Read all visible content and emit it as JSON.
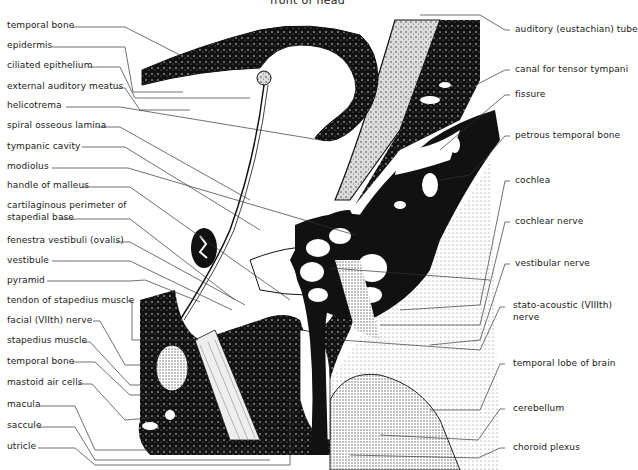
{
  "title": "front of head",
  "left_labels": [
    {
      "text": "temporal bone",
      "y": 20
    },
    {
      "text": "epidermis",
      "y": 40
    },
    {
      "text": "ciliated epithelium",
      "y": 60
    },
    {
      "text": "external auditory meatus",
      "y": 81
    },
    {
      "text": "helicotrema",
      "y": 100
    },
    {
      "text": "spiral osseous lamina",
      "y": 120
    },
    {
      "text": "tympanic cavity",
      "y": 141
    },
    {
      "text": "modiolus",
      "y": 161
    },
    {
      "text": "handle of malleus",
      "y": 180
    },
    {
      "text": "cartilaginous perimeter of",
      "y": 200
    },
    {
      "text": "stapedial base",
      "y": 212
    },
    {
      "text": "fenestra vestibuli (ovalis)",
      "y": 235
    },
    {
      "text": "vestibule",
      "y": 255
    },
    {
      "text": "pyramid",
      "y": 275
    },
    {
      "text": "tendon of stapedius muscle",
      "y": 295
    },
    {
      "text": "facial (VIIth) nerve",
      "y": 315
    },
    {
      "text": "stapedius muscle",
      "y": 335
    },
    {
      "text": "temporal bone",
      "y": 356
    },
    {
      "text": "mastoid air cells",
      "y": 377
    },
    {
      "text": "macula",
      "y": 399
    },
    {
      "text": "saccule",
      "y": 420
    },
    {
      "text": "utricle",
      "y": 441
    }
  ],
  "right_labels": [
    {
      "text": "auditory (eustachian) tube",
      "y": 24
    },
    {
      "text": "canal  for  tensor  tympani",
      "y": 64
    },
    {
      "text": "fissure",
      "y": 89
    },
    {
      "text": "petrous temporal bone",
      "y": 130
    },
    {
      "text": "cochlea",
      "y": 175
    },
    {
      "text": "cochlear nerve",
      "y": 216
    },
    {
      "text": "vestibular nerve",
      "y": 258
    },
    {
      "text": "stato-acoustic (VIIIth)",
      "y": 300
    },
    {
      "text": "nerve",
      "y": 312
    },
    {
      "text": "temporal lobe of brain",
      "y": 358
    },
    {
      "text": "cerebellum",
      "y": 403
    },
    {
      "text": "choroid plexus",
      "y": 442
    }
  ],
  "colors": {
    "ink": "#111111",
    "paper": "#ffffff",
    "stipple": "#b8b8b8"
  }
}
